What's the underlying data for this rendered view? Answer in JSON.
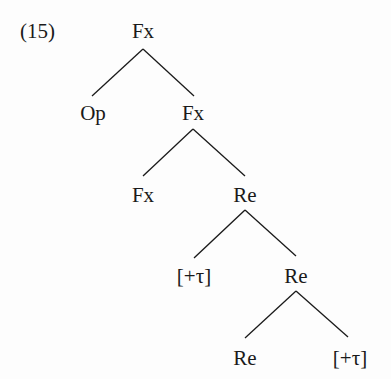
{
  "example_number": "(15)",
  "colors": {
    "ink": "#1a1a1a",
    "background": "#fdfdfd"
  },
  "nodes": [
    {
      "id": "n0",
      "label": "Fx",
      "x": 143,
      "y": 21
    },
    {
      "id": "n1",
      "label": "Op",
      "x": 93,
      "y": 103
    },
    {
      "id": "n2",
      "label": "Fx",
      "x": 193,
      "y": 103
    },
    {
      "id": "n3",
      "label": "Fx",
      "x": 143,
      "y": 185
    },
    {
      "id": "n4",
      "label": "Re",
      "x": 245,
      "y": 185
    },
    {
      "id": "n5",
      "label": "[+τ]",
      "x": 194,
      "y": 266
    },
    {
      "id": "n6",
      "label": "Re",
      "x": 296,
      "y": 266
    },
    {
      "id": "n7",
      "label": "Re",
      "x": 245,
      "y": 348
    },
    {
      "id": "n8",
      "label": "[+τ]",
      "x": 350,
      "y": 348
    }
  ],
  "edges": [
    {
      "from": "n0",
      "to": "n1",
      "x1": 143,
      "y1": 49,
      "x2": 92,
      "y2": 96
    },
    {
      "from": "n0",
      "to": "n2",
      "x1": 143,
      "y1": 49,
      "x2": 194,
      "y2": 96
    },
    {
      "from": "n2",
      "to": "n3",
      "x1": 193,
      "y1": 129,
      "x2": 143,
      "y2": 176
    },
    {
      "from": "n2",
      "to": "n4",
      "x1": 193,
      "y1": 129,
      "x2": 245,
      "y2": 176
    },
    {
      "from": "n4",
      "to": "n5",
      "x1": 245,
      "y1": 210,
      "x2": 194,
      "y2": 258
    },
    {
      "from": "n4",
      "to": "n6",
      "x1": 245,
      "y1": 210,
      "x2": 296,
      "y2": 256
    },
    {
      "from": "n6",
      "to": "n7",
      "x1": 296,
      "y1": 291,
      "x2": 245,
      "y2": 338
    },
    {
      "from": "n6",
      "to": "n8",
      "x1": 296,
      "y1": 291,
      "x2": 348,
      "y2": 337
    }
  ]
}
